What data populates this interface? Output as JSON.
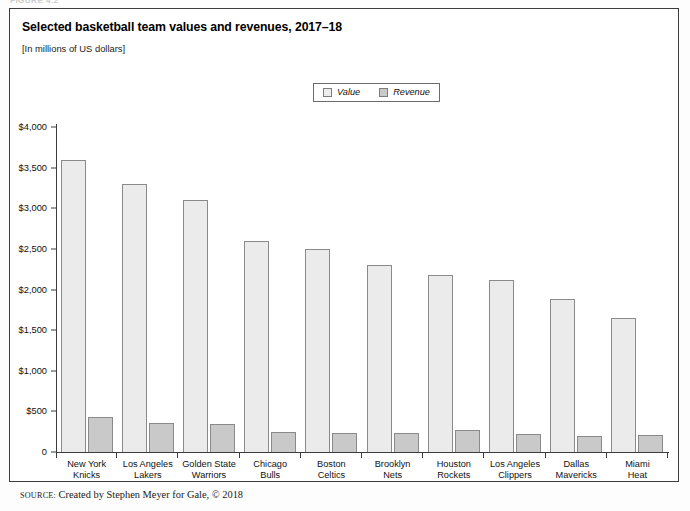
{
  "figure": {
    "label": "FIGURE 4.2",
    "title": "Selected basketball team values and revenues, 2017–18",
    "subtitle": "[In millions of US dollars]",
    "source_keyword": "SOURCE:",
    "source_text": " Created by Stephen Meyer for Gale, © 2018"
  },
  "colors": {
    "value_fill": "#ebebeb",
    "revenue_fill": "#c9c9c9",
    "bar_stroke": "#8a8a8a",
    "axis": "#3c3c3c",
    "frame": "#3c3c3c"
  },
  "chart_data": {
    "type": "bar",
    "title": "Selected basketball team values and revenues, 2017–18",
    "subtitle": "[In millions of US dollars]",
    "xlabel": "",
    "ylabel": "",
    "ylim": [
      0,
      4000
    ],
    "yticks": [
      0,
      500,
      1000,
      1500,
      2000,
      2500,
      3000,
      3500,
      4000
    ],
    "ytick_labels": [
      "0",
      "$500",
      "$1,000",
      "$1,500",
      "$2,000",
      "$2,500",
      "$3,000",
      "$3,500",
      "$4,000"
    ],
    "grid": false,
    "legend_position": "top-center",
    "categories": [
      "New York Knicks",
      "Los Angeles Lakers",
      "Golden State Warriors",
      "Chicago Bulls",
      "Boston Celtics",
      "Brooklyn Nets",
      "Houston Rockets",
      "Los Angeles Clippers",
      "Dallas Mavericks",
      "Miami Heat"
    ],
    "category_lines": [
      [
        "New York",
        "Knicks"
      ],
      [
        "Los Angeles",
        "Lakers"
      ],
      [
        "Golden State",
        "Warriors"
      ],
      [
        "Chicago",
        "Bulls"
      ],
      [
        "Boston",
        "Celtics"
      ],
      [
        "Brooklyn",
        "Nets"
      ],
      [
        "Houston",
        "Rockets"
      ],
      [
        "Los Angeles",
        "Clippers"
      ],
      [
        "Dallas",
        "Mavericks"
      ],
      [
        "Miami",
        "Heat"
      ]
    ],
    "series": [
      {
        "name": "Value",
        "values": [
          3600,
          3300,
          3100,
          2600,
          2500,
          2300,
          2180,
          2120,
          1880,
          1650
        ]
      },
      {
        "name": "Revenue",
        "values": [
          426,
          360,
          350,
          250,
          230,
          235,
          265,
          220,
          196,
          210
        ]
      }
    ]
  }
}
